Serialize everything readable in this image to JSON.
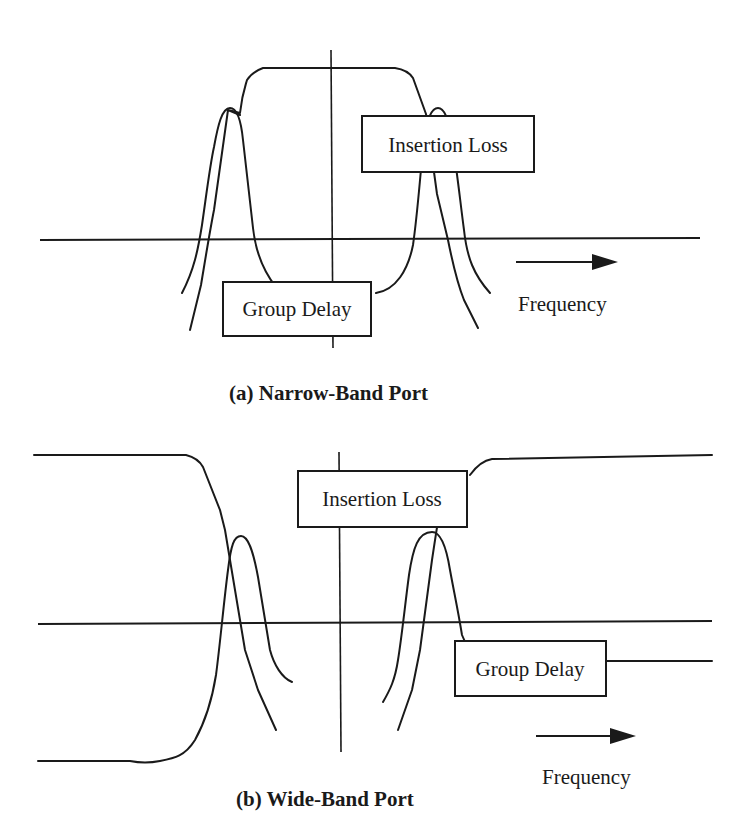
{
  "figure": {
    "panels": [
      {
        "id": "a",
        "caption": "(a)  Narrow-Band Port",
        "labels": {
          "insertion_loss": "Insertion Loss",
          "group_delay": "Group Delay",
          "frequency": "Frequency"
        }
      },
      {
        "id": "b",
        "caption": "(b) Wide-Band Port",
        "labels": {
          "insertion_loss": "Insertion Loss",
          "group_delay": "Group Delay",
          "frequency": "Frequency"
        }
      }
    ],
    "colors": {
      "line": "#1a1a1a",
      "background": "#ffffff"
    }
  }
}
